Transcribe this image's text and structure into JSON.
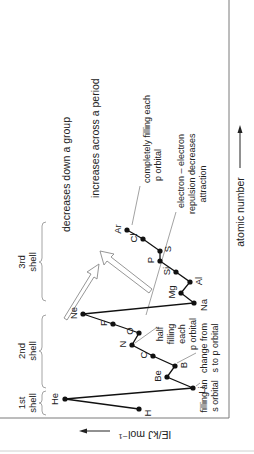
{
  "chart_data": {
    "type": "line",
    "title": "",
    "xlabel": "atomic number",
    "ylabel": "IE/kJ mol⁻¹",
    "orientation": "rotated 90° counter-clockwise",
    "grid": false,
    "legend": null,
    "x": [
      "H",
      "He",
      "Li",
      "Be",
      "B",
      "C",
      "N",
      "O",
      "F",
      "Ne",
      "Na",
      "Mg",
      "Al",
      "Si",
      "P",
      "S",
      "Cl",
      "Ar"
    ],
    "series": [
      {
        "name": "first ionisation energy",
        "values_relative": [
          0.47,
          0.88,
          0.13,
          0.34,
          0.29,
          0.44,
          0.58,
          0.53,
          0.71,
          0.91,
          0.12,
          0.26,
          0.14,
          0.29,
          0.4,
          0.37,
          0.53,
          0.64
        ]
      }
    ],
    "annotations": [
      "1st shell",
      "2nd shell",
      "3rd shell",
      "decreases down a group",
      "increases across a period",
      "completely filling each p orbital",
      "electron – electron repulsion decreases attraction",
      "half filling each p orbital",
      "change from s to p orbital",
      "filling an s orbital"
    ]
  },
  "labels": {
    "xaxis": "atomic number",
    "yaxis": "IE/kJ mol⁻¹",
    "shell1": [
      "1st",
      "shell"
    ],
    "shell2": [
      "2nd",
      "shell"
    ],
    "shell3": [
      "3rd",
      "shell"
    ],
    "group_trend": "decreases down a group",
    "period_trend": "increases across a period",
    "ann_completely": [
      "completely filling each",
      "p orbital"
    ],
    "ann_repulsion": [
      "electron – electron",
      "repulsion decreases",
      "attraction"
    ],
    "ann_half": [
      "half",
      "filling",
      "each",
      "p orbital"
    ],
    "ann_change": [
      "change from",
      "s to p orbital"
    ],
    "ann_filling_s": [
      "filling an",
      "s orbital"
    ]
  },
  "points": [
    {
      "el": "H",
      "x": 139,
      "y": 409
    },
    {
      "el": "He",
      "x": 65,
      "y": 399
    },
    {
      "el": "Li",
      "x": 193,
      "y": 388
    },
    {
      "el": "Be",
      "x": 167,
      "y": 377
    },
    {
      "el": "B",
      "x": 175,
      "y": 366
    },
    {
      "el": "C",
      "x": 153,
      "y": 356
    },
    {
      "el": "N",
      "x": 132,
      "y": 345
    },
    {
      "el": "O",
      "x": 139,
      "y": 333
    },
    {
      "el": "F",
      "x": 113,
      "y": 324
    },
    {
      "el": "Ne",
      "x": 83,
      "y": 314
    },
    {
      "el": "Na",
      "x": 194,
      "y": 303
    },
    {
      "el": "Mg",
      "x": 181,
      "y": 293
    },
    {
      "el": "Al",
      "x": 190,
      "y": 282
    },
    {
      "el": "Si",
      "x": 176,
      "y": 272
    },
    {
      "el": "P",
      "x": 160,
      "y": 261
    },
    {
      "el": "S",
      "x": 160,
      "y": 251
    },
    {
      "el": "Cl",
      "x": 143,
      "y": 239
    },
    {
      "el": "Ar",
      "x": 127,
      "y": 230
    }
  ]
}
